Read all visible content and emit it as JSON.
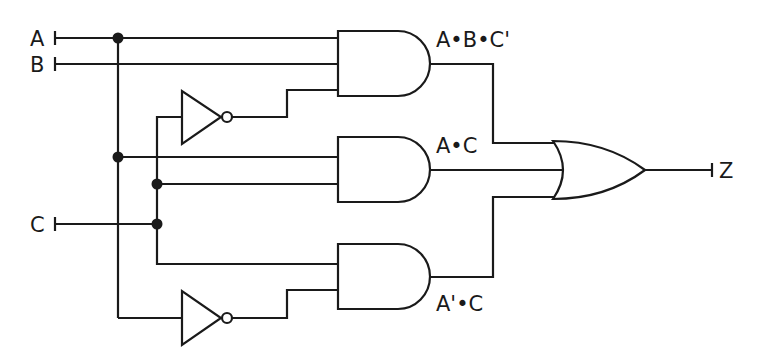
{
  "diagram": {
    "type": "logic-circuit",
    "inputs": [
      {
        "id": "A",
        "label": "A"
      },
      {
        "id": "B",
        "label": "B"
      },
      {
        "id": "C",
        "label": "C"
      }
    ],
    "output": {
      "id": "Z",
      "label": "Z"
    },
    "gates": [
      {
        "id": "not1",
        "type": "NOT",
        "input": "C"
      },
      {
        "id": "not2",
        "type": "NOT",
        "input": "A"
      },
      {
        "id": "and1",
        "type": "AND",
        "inputs": [
          "A",
          "B",
          "C'"
        ],
        "label": "A•B•C'"
      },
      {
        "id": "and2",
        "type": "AND",
        "inputs": [
          "A",
          "C"
        ],
        "label": "A•C"
      },
      {
        "id": "and3",
        "type": "AND",
        "inputs": [
          "C",
          "A'"
        ],
        "label": "A'•C"
      },
      {
        "id": "or1",
        "type": "OR",
        "inputs": [
          "and1",
          "and2",
          "and3"
        ],
        "output": "Z"
      }
    ],
    "colors": {
      "line": "#1a1a1a",
      "background": "#ffffff"
    }
  }
}
